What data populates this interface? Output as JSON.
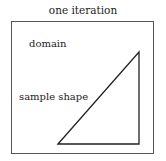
{
  "diagram": {
    "title": "one iteration",
    "labels": {
      "domain": "domain",
      "sample_shape": "sample shape"
    },
    "shape": {
      "type": "right-triangle",
      "points": [
        [
          58,
          144
        ],
        [
          139,
          52
        ],
        [
          139,
          144
        ]
      ],
      "stroke": "#222222"
    },
    "frame_color": "#555555"
  }
}
